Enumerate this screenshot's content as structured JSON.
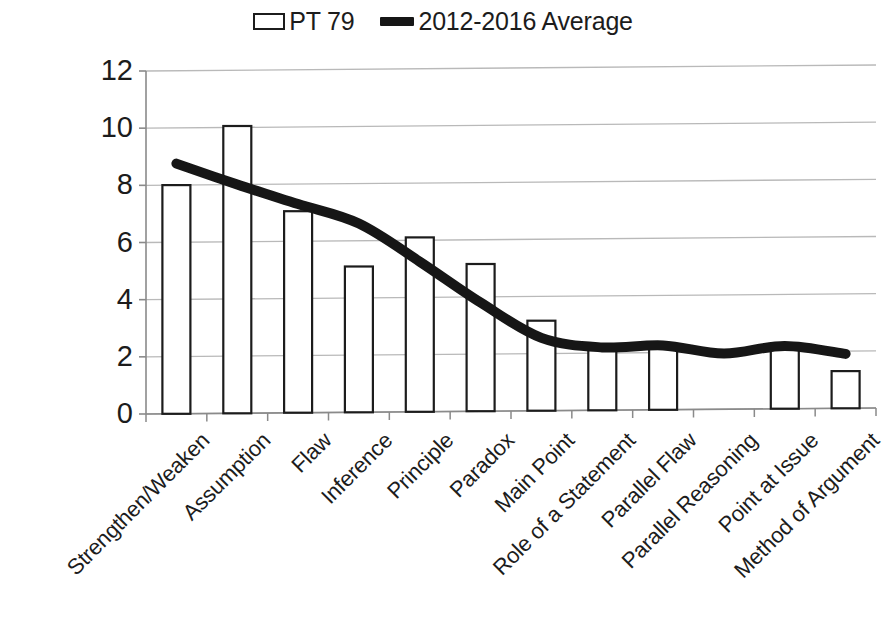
{
  "legend": {
    "entries": [
      {
        "label": "PT 79",
        "type": "bar",
        "color": "#1c1c1c"
      },
      {
        "label": "2012-2016 Average",
        "type": "line",
        "color": "#161616"
      }
    ]
  },
  "axes": {
    "y_ticks": [
      "12",
      "10",
      "8",
      "6",
      "4",
      "2",
      "0"
    ],
    "x_labels": [
      "Strengthen/Weaken",
      "Assumption",
      "Flaw",
      "Inference",
      "Principle",
      "Paradox",
      "Main Point",
      "Role of a Statement",
      "Parallel Flaw",
      "Parallel Reasoning",
      "Point at Issue",
      "Method of Argument"
    ]
  },
  "chart_data": {
    "type": "bar",
    "title": "",
    "subtitle": "",
    "xlabel": "",
    "ylabel": "",
    "ylim": [
      0,
      12
    ],
    "ytick_step": 2,
    "grid": true,
    "legend_position": "top-center",
    "categories": [
      "Strengthen/Weaken",
      "Assumption",
      "Flaw",
      "Inference",
      "Principle",
      "Paradox",
      "Main Point",
      "Role of a Statement",
      "Parallel Flaw",
      "Parallel Reasoning",
      "Point at Issue",
      "Method of Argument"
    ],
    "series": [
      {
        "name": "PT 79",
        "type": "bar",
        "values": [
          8.0,
          10.05,
          7.05,
          5.1,
          6.1,
          5.15,
          3.15,
          2.2,
          2.2,
          0,
          2.25,
          1.3
        ]
      },
      {
        "name": "2012-2016 Average",
        "type": "line",
        "values": [
          8.75,
          8.0,
          7.3,
          6.6,
          5.25,
          3.8,
          2.55,
          2.2,
          2.25,
          1.95,
          2.2,
          1.9
        ]
      }
    ]
  },
  "style": {
    "bar_stroke": "#1c1c1c",
    "bar_fill": "#ffffff",
    "line_color": "#161616",
    "grid_color": "#b9b9b9",
    "axis_color": "#8a8a8a"
  }
}
